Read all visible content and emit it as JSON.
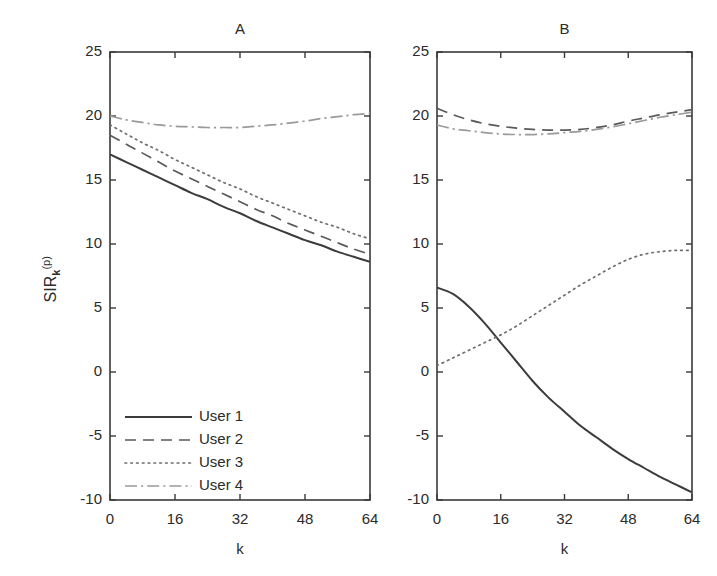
{
  "figure": {
    "background": "#ffffff",
    "axis_color": "#3a3a3a",
    "text_color": "#2b2b2b",
    "ylabel_main": "SIR",
    "ylabel_sub": "k",
    "ylabel_sup": "(p)"
  },
  "chart_data": [
    {
      "type": "line",
      "title": "A",
      "xlabel": "k",
      "ylabel": "SIR_k^(p)",
      "xlim": [
        0,
        64
      ],
      "ylim": [
        -10,
        25
      ],
      "xticks": [
        0,
        16,
        32,
        48,
        64
      ],
      "yticks": [
        -10,
        -5,
        0,
        5,
        10,
        15,
        20,
        25
      ],
      "xticklabels": [
        "0",
        "16",
        "32",
        "48",
        "64"
      ],
      "yticklabels": [
        "-10",
        "-5",
        "0",
        "5",
        "10",
        "15",
        "20",
        "25"
      ],
      "grid": false,
      "legend_position": "lower-left",
      "x": [
        0,
        4,
        8,
        12,
        16,
        20,
        24,
        28,
        32,
        36,
        40,
        44,
        48,
        52,
        56,
        60,
        64
      ],
      "series": [
        {
          "name": "User 1",
          "style": "solid",
          "color": "#3c3c3c",
          "values": [
            17.0,
            16.4,
            15.8,
            15.2,
            14.6,
            14.0,
            13.5,
            12.9,
            12.4,
            11.8,
            11.3,
            10.8,
            10.3,
            9.9,
            9.4,
            9.0,
            8.6
          ]
        },
        {
          "name": "User 2",
          "style": "dashed",
          "color": "#5a5a5a",
          "values": [
            18.5,
            17.8,
            17.1,
            16.4,
            15.7,
            15.1,
            14.5,
            13.9,
            13.3,
            12.7,
            12.2,
            11.6,
            11.1,
            10.6,
            10.1,
            9.6,
            9.2
          ]
        },
        {
          "name": "User 3",
          "style": "dotted",
          "color": "#6e6e6e",
          "values": [
            19.3,
            18.6,
            17.9,
            17.3,
            16.6,
            16.0,
            15.4,
            14.8,
            14.3,
            13.7,
            13.2,
            12.7,
            12.2,
            11.7,
            11.3,
            10.8,
            10.4
          ]
        },
        {
          "name": "User 4",
          "style": "dashdot",
          "color": "#9a9a9a",
          "values": [
            20.0,
            19.7,
            19.5,
            19.3,
            19.2,
            19.15,
            19.1,
            19.1,
            19.1,
            19.2,
            19.3,
            19.45,
            19.6,
            19.8,
            19.95,
            20.1,
            20.2
          ]
        }
      ]
    },
    {
      "type": "line",
      "title": "B",
      "xlabel": "k",
      "ylabel": "SIR_k^(p)",
      "xlim": [
        0,
        64
      ],
      "ylim": [
        -10,
        25
      ],
      "xticks": [
        0,
        16,
        32,
        48,
        64
      ],
      "yticks": [
        -10,
        -5,
        0,
        5,
        10,
        15,
        20,
        25
      ],
      "xticklabels": [
        "0",
        "16",
        "32",
        "48",
        "64"
      ],
      "yticklabels": [
        "-10",
        "-5",
        "0",
        "5",
        "10",
        "15",
        "20",
        "25"
      ],
      "grid": false,
      "legend_position": "none",
      "x": [
        0,
        4,
        8,
        12,
        16,
        20,
        24,
        28,
        32,
        36,
        40,
        44,
        48,
        52,
        56,
        60,
        64
      ],
      "series": [
        {
          "name": "User 1",
          "style": "solid",
          "color": "#3c3c3c",
          "values": [
            6.6,
            6.1,
            5.1,
            3.8,
            2.3,
            0.8,
            -0.7,
            -2.0,
            -3.1,
            -4.2,
            -5.1,
            -6.0,
            -6.8,
            -7.5,
            -8.2,
            -8.8,
            -9.4
          ]
        },
        {
          "name": "User 2",
          "style": "dashed",
          "color": "#5a5a5a",
          "values": [
            20.6,
            20.1,
            19.7,
            19.4,
            19.2,
            19.05,
            18.95,
            18.9,
            18.9,
            18.95,
            19.1,
            19.3,
            19.6,
            19.85,
            20.1,
            20.3,
            20.5
          ]
        },
        {
          "name": "User 3",
          "style": "dotted",
          "color": "#6e6e6e",
          "values": [
            0.5,
            1.1,
            1.7,
            2.3,
            2.9,
            3.6,
            4.4,
            5.2,
            6.0,
            6.8,
            7.5,
            8.2,
            8.8,
            9.2,
            9.4,
            9.5,
            9.5
          ]
        },
        {
          "name": "User 4",
          "style": "dashdot",
          "color": "#9a9a9a",
          "values": [
            19.3,
            19.0,
            18.85,
            18.7,
            18.6,
            18.55,
            18.55,
            18.6,
            18.7,
            18.8,
            18.95,
            19.15,
            19.4,
            19.65,
            19.9,
            20.1,
            20.3
          ]
        }
      ]
    }
  ],
  "legend": {
    "items": [
      {
        "label": "User 1",
        "style": "solid"
      },
      {
        "label": "User 2",
        "style": "dashed"
      },
      {
        "label": "User 3",
        "style": "dotted"
      },
      {
        "label": "User 4",
        "style": "dashdot"
      }
    ]
  }
}
